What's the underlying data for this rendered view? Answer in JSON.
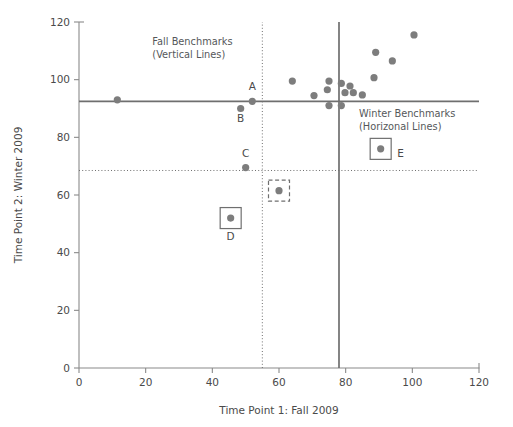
{
  "chart_data": {
    "type": "scatter",
    "title": "",
    "xlabel": "Time Point 1: Fall 2009",
    "ylabel": "Time Point 2: Winter 2009",
    "xlim": [
      0,
      120
    ],
    "ylim": [
      0,
      120
    ],
    "xticks": [
      0,
      20,
      40,
      60,
      80,
      100,
      120
    ],
    "yticks": [
      0,
      20,
      40,
      60,
      80,
      100,
      120
    ],
    "xticklabels": [
      "0",
      "20",
      "40",
      "60",
      "80",
      "100",
      "120"
    ],
    "yticklabels": [
      "0",
      "20",
      "40",
      "60",
      "80",
      "100",
      "120"
    ],
    "grid": false,
    "legend": "none",
    "marker_color": "#7d7d7d",
    "line_color": "#6f6f6f",
    "points": [
      {
        "x": 11.5,
        "y": 93.0,
        "label": "",
        "box": "none"
      },
      {
        "x": 48.5,
        "y": 90.0,
        "label": "B",
        "box": "none",
        "label_pos": "below"
      },
      {
        "x": 52.0,
        "y": 92.5,
        "label": "A",
        "box": "none",
        "label_pos": "above"
      },
      {
        "x": 50.0,
        "y": 69.5,
        "label": "C",
        "box": "none",
        "label_pos": "above"
      },
      {
        "x": 45.5,
        "y": 52.0,
        "label": "D",
        "box": "solid",
        "label_pos": "below"
      },
      {
        "x": 60.0,
        "y": 61.5,
        "label": "",
        "box": "dashed"
      },
      {
        "x": 64.0,
        "y": 99.5,
        "label": "",
        "box": "none"
      },
      {
        "x": 70.5,
        "y": 94.5,
        "label": "",
        "box": "none"
      },
      {
        "x": 74.5,
        "y": 96.5,
        "label": "",
        "box": "none"
      },
      {
        "x": 75.0,
        "y": 99.5,
        "label": "",
        "box": "none"
      },
      {
        "x": 75.0,
        "y": 91.0,
        "label": "",
        "box": "none"
      },
      {
        "x": 78.7,
        "y": 98.7,
        "label": "",
        "box": "none"
      },
      {
        "x": 78.7,
        "y": 91.0,
        "label": "",
        "box": "none"
      },
      {
        "x": 79.8,
        "y": 95.5,
        "label": "",
        "box": "none"
      },
      {
        "x": 81.3,
        "y": 97.8,
        "label": "",
        "box": "none"
      },
      {
        "x": 82.3,
        "y": 95.5,
        "label": "",
        "box": "none"
      },
      {
        "x": 85.0,
        "y": 94.7,
        "label": "",
        "box": "none"
      },
      {
        "x": 88.5,
        "y": 100.7,
        "label": "",
        "box": "none"
      },
      {
        "x": 89.0,
        "y": 109.5,
        "label": "",
        "box": "none"
      },
      {
        "x": 90.5,
        "y": 76.0,
        "label": "E",
        "box": "solid",
        "label_pos": "right"
      },
      {
        "x": 94.0,
        "y": 106.5,
        "label": "",
        "box": "none"
      },
      {
        "x": 100.5,
        "y": 115.5,
        "label": "",
        "box": "none"
      }
    ],
    "reference_lines": [
      {
        "orientation": "vertical",
        "value": 55.0,
        "style": "dotted",
        "group": "Fall Benchmarks"
      },
      {
        "orientation": "vertical",
        "value": 78.0,
        "style": "solid",
        "group": "Fall Benchmarks"
      },
      {
        "orientation": "horizontal",
        "value": 92.5,
        "style": "solid",
        "group": "Winter Benchmarks"
      },
      {
        "orientation": "horizontal",
        "value": 68.5,
        "style": "dotted",
        "group": "Winter Benchmarks"
      }
    ],
    "annotations": [
      {
        "name": "fall-benchmarks-note",
        "line1": "Fall Benchmarks",
        "line2": "(Vertical Lines)",
        "x": 22.0,
        "y": 112.0
      },
      {
        "name": "winter-benchmarks-note",
        "line1": "Winter Benchmarks",
        "line2": "(Horizonal Lines)",
        "x": 84.0,
        "y": 87.0
      }
    ]
  },
  "axes": {
    "x_title": "Time Point 1: Fall 2009",
    "y_title": "Time Point 2: Winter 2009"
  },
  "annotations": {
    "fall": {
      "line1": "Fall Benchmarks",
      "line2": "(Vertical Lines)"
    },
    "winter": {
      "line1": "Winter Benchmarks",
      "line2": "(Horizonal Lines)"
    }
  },
  "tick_labels": {
    "x": [
      "0",
      "20",
      "40",
      "60",
      "80",
      "100",
      "120"
    ],
    "y": [
      "0",
      "20",
      "40",
      "60",
      "80",
      "100",
      "120"
    ]
  },
  "point_labels": {
    "a": "A",
    "b": "B",
    "c": "C",
    "d": "D",
    "e": "E"
  },
  "colors": {
    "marker": "#7d7d7d",
    "line": "#6f6f6f",
    "axis": "#8a8a8a",
    "text": "#4a4a4a"
  }
}
